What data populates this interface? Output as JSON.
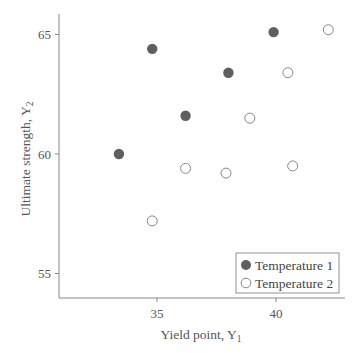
{
  "chart_data": {
    "type": "scatter",
    "title": "",
    "xlabel": "Yield point, Y",
    "xlabel_sub": "1",
    "ylabel": "Ultimate strength, Y",
    "ylabel_sub": "2",
    "xlim": [
      31.2,
      43.0
    ],
    "ylim": [
      53.0,
      66.7
    ],
    "xticks": [
      35,
      40
    ],
    "yticks": [
      55,
      60,
      65
    ],
    "grid": false,
    "legend_position": "lower right",
    "series": [
      {
        "name": "Temperature 1",
        "marker": "filled-circle",
        "color": "#5f5f5f",
        "points": [
          {
            "x": 33.4,
            "y": 60.0
          },
          {
            "x": 34.8,
            "y": 64.4
          },
          {
            "x": 36.2,
            "y": 61.6
          },
          {
            "x": 38.0,
            "y": 63.4
          },
          {
            "x": 39.9,
            "y": 65.1
          }
        ]
      },
      {
        "name": "Temperature 2",
        "marker": "open-circle",
        "color": "#7a7a7a",
        "points": [
          {
            "x": 34.8,
            "y": 57.2
          },
          {
            "x": 36.2,
            "y": 59.4
          },
          {
            "x": 37.9,
            "y": 59.2
          },
          {
            "x": 38.9,
            "y": 61.5
          },
          {
            "x": 40.5,
            "y": 63.4
          },
          {
            "x": 40.7,
            "y": 59.5
          },
          {
            "x": 42.2,
            "y": 65.2
          }
        ]
      }
    ]
  }
}
